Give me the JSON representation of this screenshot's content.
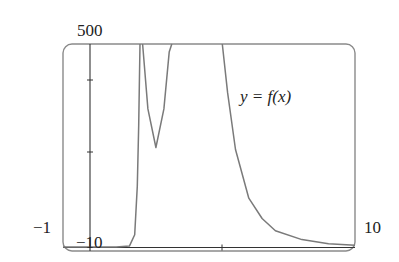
{
  "chart_data": {
    "type": "line",
    "title": "",
    "legend_label": "y = f(x)",
    "xlabel": "",
    "ylabel": "",
    "xlim": [
      -1,
      10
    ],
    "ylim": [
      -10,
      500
    ],
    "axis_labels": {
      "x_min": "−1",
      "x_max": "10",
      "y_max": "500",
      "y_min": "−10"
    },
    "x_ticks": [
      5
    ],
    "y_ticks": [
      200,
      400
    ],
    "grid": false,
    "series": [
      {
        "name": "f(x)",
        "x": [
          -1,
          0,
          1,
          1.5,
          1.7,
          1.8,
          1.85,
          1.9,
          2.0,
          2.2,
          2.5,
          2.8,
          3.0,
          3.1,
          5.0,
          5.2,
          5.5,
          6.0,
          6.5,
          7.0,
          8.0,
          9.0,
          10.0
        ],
        "y": [
          0,
          0,
          0,
          2,
          30,
          150,
          300,
          500,
          500,
          340,
          245,
          340,
          480,
          500,
          500,
          380,
          240,
          120,
          70,
          40,
          18,
          8,
          4
        ]
      }
    ]
  },
  "labels": {
    "y_max": "500",
    "x_min": "−1",
    "x_max": "10",
    "y_min": "−10",
    "legend": "y = f(x)"
  }
}
